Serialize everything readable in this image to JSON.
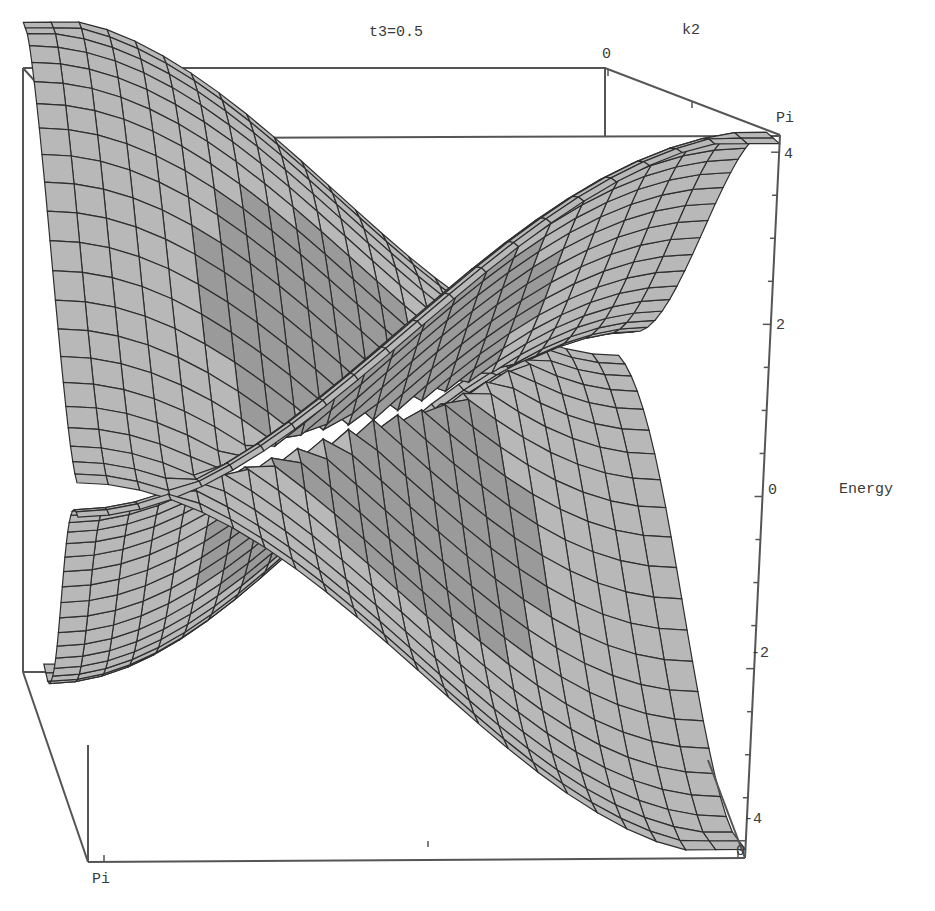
{
  "chart_data": {
    "type": "surface3d",
    "title": "t3=0.5",
    "axes": {
      "k1": {
        "label": "",
        "range_labels": [
          "0",
          "Pi"
        ],
        "tick_labels_visible": [
          "Pi",
          "0"
        ]
      },
      "k2": {
        "label": "k2",
        "range_labels": [
          "0",
          "Pi"
        ]
      },
      "energy": {
        "label": "Energy",
        "ticks": [
          -4,
          -2,
          0,
          2,
          4
        ],
        "range": [
          -4.2,
          4.2
        ]
      }
    },
    "surfaces": [
      {
        "name": "upper band",
        "description": "positive energy band, maxima ~ +4 at corners and center ridges, touching the lower band at Dirac-like points near E=0"
      },
      {
        "name": "lower band",
        "description": "negative energy band, mirror of upper band, minima ~ -4"
      }
    ],
    "style": {
      "mesh": true,
      "shading": "gray",
      "box": true,
      "grid_on_surface": true
    },
    "colors": {
      "surface_fill": "#9a9a9a",
      "surface_light": "#b8b8b8",
      "surface_dark": "#5a5a5a",
      "mesh_line": "#2e2e2e",
      "box_line": "#555555"
    }
  },
  "labels": {
    "title": "t3=0.5",
    "k2_axis": "k2",
    "k2_zero": "0",
    "k2_pi": "Pi",
    "energy_axis": "Energy",
    "energy_ticks": [
      "4",
      "2",
      "0",
      "-2",
      "-4"
    ],
    "k1_pi": "Pi",
    "k1_zero": "0"
  }
}
